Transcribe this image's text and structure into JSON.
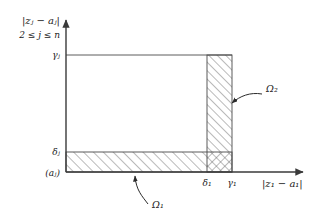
{
  "figure": {
    "type": "math-diagram",
    "background_color": "#ffffff",
    "line_color": "#3a3a3a",
    "hatch_color": "#555555"
  },
  "axes": {
    "y_axis": {
      "title": "|zⱼ − aⱼ|",
      "condition": "2 ≤ j ≤ n",
      "ticks": [
        {
          "label": "γⱼ",
          "name": "gamma-j"
        },
        {
          "label": "δⱼ",
          "name": "delta-j"
        }
      ]
    },
    "x_axis": {
      "title": "|z₁ − a₁|",
      "ticks": [
        {
          "label": "δ₁",
          "name": "delta-1"
        },
        {
          "label": "γ₁",
          "name": "gamma-1"
        }
      ]
    },
    "origin": {
      "label": "(aⱼ)"
    }
  },
  "regions": [
    {
      "name": "omega-1",
      "label": "Ω₁",
      "orientation": "horizontal-band",
      "hatch": "forward-diagonal"
    },
    {
      "name": "omega-2",
      "label": "Ω₂",
      "orientation": "vertical-strip",
      "hatch": "forward-diagonal"
    }
  ]
}
